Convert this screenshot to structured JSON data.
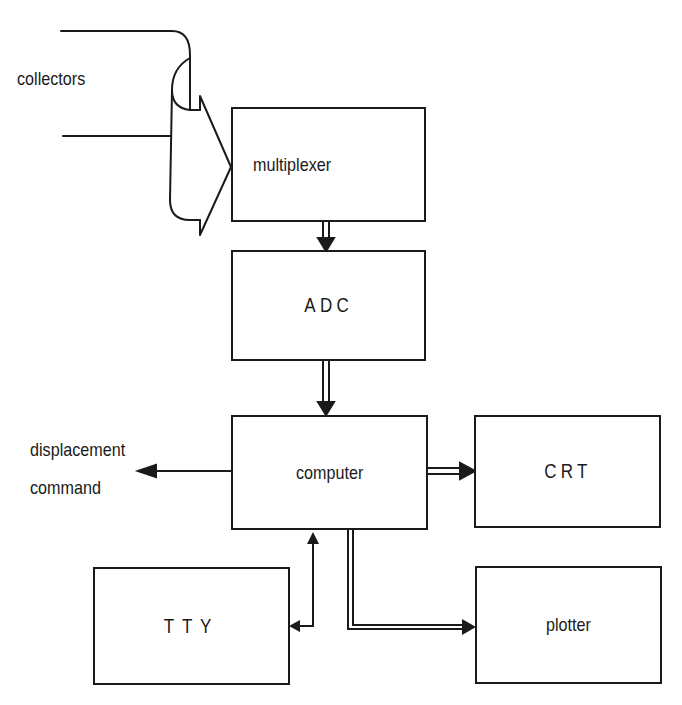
{
  "diagram": {
    "type": "block-diagram",
    "labels": {
      "collectors": "collectors",
      "displacement_line1": "displacement",
      "displacement_line2": "command"
    },
    "blocks": {
      "multiplexer": "multiplexer",
      "adc": "ADC",
      "computer": "computer",
      "crt": "CRT",
      "tty": "TTY",
      "plotter": "plotter"
    },
    "connections": [
      {
        "from": "collectors",
        "to": "multiplexer",
        "style": "wide-bus-arrow"
      },
      {
        "from": "multiplexer",
        "to": "ADC",
        "style": "double-line-arrow"
      },
      {
        "from": "ADC",
        "to": "computer",
        "style": "double-line-arrow"
      },
      {
        "from": "computer",
        "to": "displacement command",
        "style": "single-arrow"
      },
      {
        "from": "computer",
        "to": "CRT",
        "style": "double-line-arrow"
      },
      {
        "from": "computer",
        "to": "plotter",
        "style": "double-line-arrow"
      },
      {
        "from": "computer",
        "to": "TTY",
        "style": "bidirectional-single"
      }
    ],
    "colors": {
      "line": "#1a1a1a",
      "background": "#ffffff"
    }
  }
}
